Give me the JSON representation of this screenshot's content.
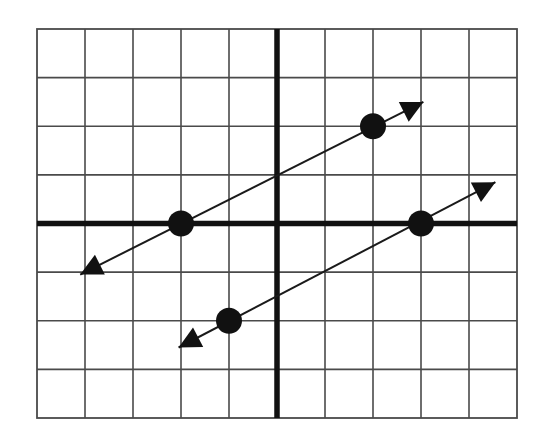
{
  "chart_data": {
    "type": "line",
    "title": "",
    "xlabel": "",
    "ylabel": "",
    "xlim": [
      -5,
      5
    ],
    "ylim": [
      -4,
      4
    ],
    "grid": true,
    "grid_step": 1,
    "axes_emphasized": true,
    "legend": "none",
    "series": [
      {
        "name": "line-upper",
        "slope": 0.5,
        "points": [
          [
            -2,
            0
          ],
          [
            2,
            2
          ]
        ],
        "arrow_ends": [
          [
            -4.1,
            -1.05
          ],
          [
            3.05,
            2.5
          ]
        ]
      },
      {
        "name": "line-lower",
        "slope": 0.5,
        "points": [
          [
            3,
            0
          ],
          [
            -1,
            -2
          ]
        ],
        "arrow_ends": [
          [
            -2.05,
            -2.55
          ],
          [
            4.55,
            0.85
          ]
        ]
      }
    ],
    "colors": {
      "grid": "#4a4a4a",
      "axis": "#111111",
      "marks": "#111111"
    }
  }
}
